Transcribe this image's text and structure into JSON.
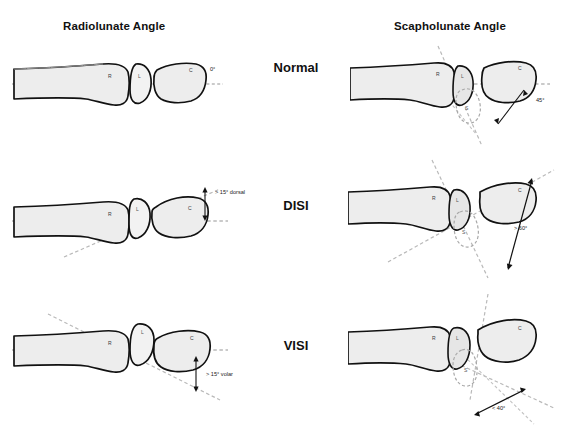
{
  "figure": {
    "title_left": "Radiolunate Angle",
    "title_right": "Scapholunate Angle",
    "bone_labels": {
      "radius": "R",
      "lunate": "L",
      "capitate": "C",
      "scaphoid": "S"
    }
  },
  "rows": [
    {
      "label": "Normal",
      "left_annotation": "0°",
      "right_annotation": "45°"
    },
    {
      "label": "DISI",
      "left_annotation": "> 15° dorsal",
      "right_annotation": "> 60°"
    },
    {
      "label": "VISI",
      "left_annotation": "> 15° volar",
      "right_annotation": "< 40°"
    }
  ],
  "colors": {
    "bone_outline": "#111111",
    "bone_fill": "#ededed",
    "reference_line": "#b0b0b0",
    "background": "#ffffff",
    "text": "#111111"
  }
}
